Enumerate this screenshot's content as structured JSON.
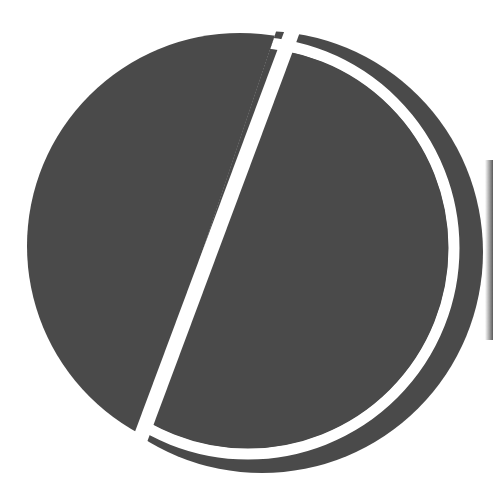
{
  "graphic": {
    "description": "Dark gray circle divided by a diagonal white stroke, with a white crescent arc and outer dark crescent on the right",
    "colors": {
      "fill": "#4a4a4a",
      "stroke": "#ffffff",
      "background": "#ffffff",
      "edge_shadow": "#3c3c3c"
    },
    "main_circle": {
      "cx": 240,
      "cy": 246,
      "r": 213
    },
    "outer_crescent": {
      "cx": 262,
      "cy": 252,
      "r": 221
    },
    "white_arc": {
      "cx": 248,
      "cy": 248,
      "r": 206,
      "width": 10
    },
    "diagonal_line": {
      "x1": 300,
      "y1": 10,
      "x2": 140,
      "y2": 438,
      "width": 15
    },
    "label": "circle-slash mark"
  }
}
